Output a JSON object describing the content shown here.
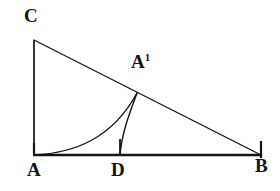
{
  "figure": {
    "background_color": "#ffffff",
    "stroke_color": "#141414",
    "labels": {
      "c": "C",
      "a": "A",
      "b": "B",
      "d": "D",
      "a_prime_base": "A",
      "a_prime_sup": "1"
    },
    "points": {
      "A": {
        "x": 34,
        "y": 155
      },
      "B": {
        "x": 261,
        "y": 155
      },
      "C": {
        "x": 34,
        "y": 40
      },
      "D": {
        "x": 120,
        "y": 155
      },
      "A1": {
        "x": 137,
        "y": 93
      }
    },
    "segments": [
      {
        "name": "base-AB",
        "from": "A",
        "to": "B",
        "width": 2.4
      },
      {
        "name": "leg-AC",
        "from": "A",
        "to": "C",
        "width": 1.6
      },
      {
        "name": "hypotenuse-CB",
        "from": "C",
        "to": "B",
        "width": 1.3
      }
    ],
    "curves": [
      {
        "name": "curve-A-to-A1",
        "from": "A",
        "to": "A1",
        "width": 1.3
      },
      {
        "name": "curve-A1-to-D",
        "from": "A1",
        "to": "D",
        "width": 1.3
      }
    ],
    "ticks": [
      {
        "name": "tick-A",
        "x": 34,
        "top": 143,
        "bottom": 155
      },
      {
        "name": "tick-D",
        "x": 120,
        "top": 139,
        "bottom": 155
      },
      {
        "name": "tick-B",
        "x": 261,
        "top": 141,
        "bottom": 158
      }
    ]
  }
}
